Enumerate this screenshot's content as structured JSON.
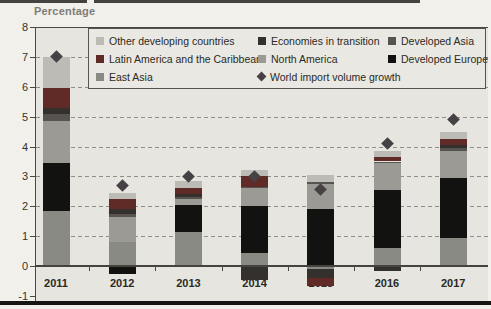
{
  "figure": {
    "y_axis_title": "Percentage"
  },
  "legend": {
    "items": [
      {
        "label": "Other developing countries",
        "shape": "square",
        "color": "#bcbbb6"
      },
      {
        "label": "Economies in transition",
        "shape": "square",
        "color": "#33302d"
      },
      {
        "label": "Developed Asia",
        "shape": "square",
        "color": "#57544f"
      },
      {
        "label": "Latin America and the Caribbean",
        "shape": "square",
        "color": "#602b26"
      },
      {
        "label": "North America",
        "shape": "square",
        "color": "#9b9a94"
      },
      {
        "label": "Developed Europe",
        "shape": "square",
        "color": "#121210"
      },
      {
        "label": "East Asia",
        "shape": "square",
        "color": "#8a8a84"
      },
      {
        "label": "World import volume growth",
        "shape": "diamond",
        "color": "#474044"
      }
    ]
  },
  "chart_data": {
    "type": "bar",
    "stacked": true,
    "title": "",
    "xlabel": "",
    "ylabel": "Percentage",
    "categories": [
      "2011",
      "2012",
      "2013",
      "2014",
      "2015",
      "2016",
      "2017"
    ],
    "ylim": [
      -1,
      8
    ],
    "y_ticks": [
      8,
      7,
      6,
      5,
      4,
      3,
      2,
      1,
      0,
      -1
    ],
    "gridline_values": [
      7,
      6,
      5,
      4,
      3,
      2,
      1
    ],
    "grid": "dashed horizontal",
    "legend_position": "top inside plot",
    "series": [
      {
        "name": "East Asia",
        "color": "#8a8a84",
        "values": [
          1.85,
          0.8,
          1.15,
          0.45,
          -0.1,
          0.6,
          0.95
        ]
      },
      {
        "name": "Developed Europe",
        "color": "#121210",
        "values": [
          1.6,
          -0.25,
          0.9,
          1.55,
          1.9,
          1.95,
          2.0
        ]
      },
      {
        "name": "North America",
        "color": "#9b9a94",
        "values": [
          1.4,
          0.85,
          0.2,
          0.6,
          0.85,
          0.9,
          0.9
        ]
      },
      {
        "name": "Developed Asia",
        "color": "#57544f",
        "values": [
          0.25,
          0.1,
          0.05,
          0.05,
          0.05,
          0.05,
          0.1
        ]
      },
      {
        "name": "Economies in transition",
        "color": "#33302d",
        "values": [
          0.2,
          0.15,
          0.1,
          -0.45,
          -0.3,
          -0.15,
          0.1
        ]
      },
      {
        "name": "Latin America and the Caribbean",
        "color": "#602b26",
        "values": [
          0.65,
          0.35,
          0.2,
          0.35,
          -0.25,
          0.15,
          0.2
        ]
      },
      {
        "name": "Other developing countries",
        "color": "#bcbbb6",
        "values": [
          1.05,
          0.2,
          0.25,
          0.2,
          0.25,
          0.2,
          0.25
        ]
      }
    ],
    "marker_series": {
      "name": "World import volume growth",
      "marker": "diamond",
      "color": "#474044",
      "values": [
        7.0,
        2.7,
        3.0,
        3.0,
        2.55,
        4.1,
        4.9
      ]
    }
  }
}
